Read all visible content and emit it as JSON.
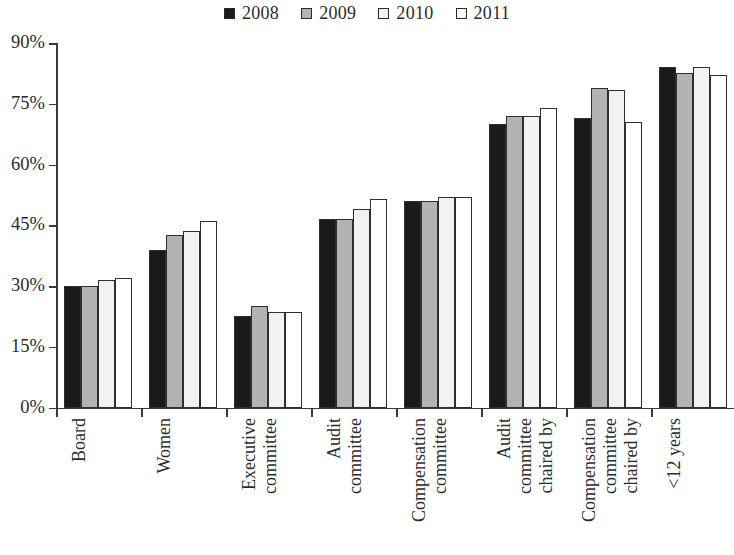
{
  "chart_data": {
    "type": "bar",
    "title": "",
    "subtitle": "",
    "xlabel": "",
    "ylabel": "",
    "ylim": [
      0,
      90
    ],
    "y_ticks": [
      0,
      15,
      30,
      45,
      60,
      75,
      90
    ],
    "y_tick_labels": [
      "0%",
      "15%",
      "30%",
      "45%",
      "60%",
      "75%",
      "90%"
    ],
    "grid": false,
    "legend_position": "top-center",
    "categories": [
      "Board",
      "Women",
      "Executive committee",
      "Audit committee",
      "Compensation committee",
      "Audit committee chaired by",
      "Compensation committee chaired by",
      "<12 years"
    ],
    "category_lines": [
      [
        "Board"
      ],
      [
        "Women"
      ],
      [
        "Executive",
        "committee"
      ],
      [
        "Audit",
        "committee"
      ],
      [
        "Compensation",
        "committee"
      ],
      [
        "Audit",
        "committee",
        "chaired by"
      ],
      [
        "Compensation",
        "committee",
        "chaired by"
      ],
      [
        "<12 years"
      ]
    ],
    "series": [
      {
        "name": "2008",
        "color": "#1a1a1a",
        "values": [
          30,
          39,
          22.5,
          46.5,
          51,
          70,
          71.5,
          84
        ]
      },
      {
        "name": "2009",
        "color": "#b3b3b3",
        "values": [
          30,
          42.5,
          25,
          46.5,
          51,
          72,
          79,
          82.5
        ]
      },
      {
        "name": "2010",
        "color": "#f2f2f2",
        "values": [
          31.5,
          43.5,
          23.5,
          49,
          52,
          72,
          78.5,
          84
        ]
      },
      {
        "name": "2011",
        "color": "#ffffff",
        "values": [
          32,
          46,
          23.5,
          51.5,
          52,
          74,
          70.5,
          82
        ]
      }
    ]
  },
  "legend": {
    "entries": [
      {
        "label": "2008",
        "swatch": "legend-swatch-2008"
      },
      {
        "label": "2009",
        "swatch": "legend-swatch-2009"
      },
      {
        "label": "2010",
        "swatch": "legend-swatch-2010"
      },
      {
        "label": "2011",
        "swatch": "legend-swatch-2011"
      }
    ]
  }
}
